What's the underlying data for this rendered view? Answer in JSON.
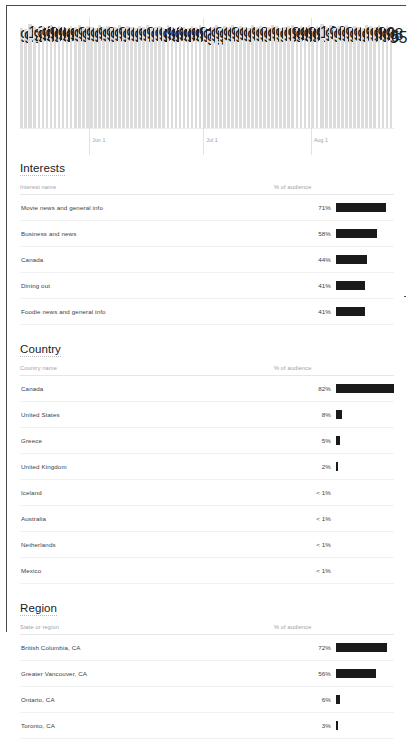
{
  "chart_data": {
    "type": "bar",
    "title": "",
    "xlabel": "",
    "ylabel": "",
    "legend": "none",
    "grid": true,
    "tick_labels": [
      "Jun 1",
      "Jul 1",
      "Aug 1"
    ],
    "tick_positions_pct": [
      18.5,
      49.0,
      77.8
    ],
    "bar_color": "#dcdcdc",
    "n_bars": 92,
    "values": [
      96,
      95,
      100,
      97,
      96,
      98,
      97,
      99,
      96,
      98,
      97,
      96,
      98,
      97,
      99,
      96,
      98,
      97,
      96,
      99,
      97,
      98,
      96,
      97,
      99,
      96,
      98,
      97,
      96,
      98,
      97,
      99,
      96,
      97,
      98,
      96,
      99,
      97,
      96,
      98,
      97,
      96,
      98,
      97,
      99,
      96,
      93,
      97,
      99,
      96,
      98,
      97,
      99,
      96,
      98,
      97,
      96,
      99,
      97,
      98,
      96,
      97,
      99,
      98,
      96,
      97,
      98,
      99,
      96,
      98,
      97,
      99,
      96,
      98,
      100,
      97,
      99,
      96,
      98,
      97,
      99,
      96,
      98,
      97,
      96,
      99,
      98,
      97,
      99,
      96,
      98,
      95
    ],
    "ylim": [
      0,
      100
    ]
  },
  "sections": [
    {
      "title": "Interests",
      "name_header": "Interest name",
      "pct_header": "% of audience",
      "rows": [
        {
          "name": "Movie news and general info",
          "pct": "71%",
          "value": 71
        },
        {
          "name": "Business and news",
          "pct": "58%",
          "value": 58
        },
        {
          "name": "Canada",
          "pct": "44%",
          "value": 44
        },
        {
          "name": "Dining out",
          "pct": "41%",
          "value": 41
        },
        {
          "name": "Foodie news and general info",
          "pct": "41%",
          "value": 41
        }
      ]
    },
    {
      "title": "Country",
      "name_header": "Country name",
      "pct_header": "% of audience",
      "rows": [
        {
          "name": "Canada",
          "pct": "82%",
          "value": 82
        },
        {
          "name": "United States",
          "pct": "8%",
          "value": 8
        },
        {
          "name": "Greece",
          "pct": "5%",
          "value": 5
        },
        {
          "name": "United Kingdom",
          "pct": "2%",
          "value": 2
        },
        {
          "name": "Iceland",
          "pct": "< 1%",
          "value": 0
        },
        {
          "name": "Australia",
          "pct": "< 1%",
          "value": 0
        },
        {
          "name": "Netherlands",
          "pct": "< 1%",
          "value": 0
        },
        {
          "name": "Mexico",
          "pct": "< 1%",
          "value": 0
        }
      ]
    },
    {
      "title": "Region",
      "name_header": "State or region",
      "pct_header": "% of audience",
      "rows": [
        {
          "name": "British Columbia, CA",
          "pct": "72%",
          "value": 72
        },
        {
          "name": "Greater Vancouver, CA",
          "pct": "56%",
          "value": 56
        },
        {
          "name": "Ontario, CA",
          "pct": "6%",
          "value": 6
        },
        {
          "name": "Toronto, CA",
          "pct": "3%",
          "value": 3
        }
      ]
    }
  ],
  "colors": {
    "bar_dark": "#1a1a1a",
    "bar_light": "#dcdcdc",
    "frame": "#4a4a4a",
    "muted_text": "#9aa0a6"
  }
}
